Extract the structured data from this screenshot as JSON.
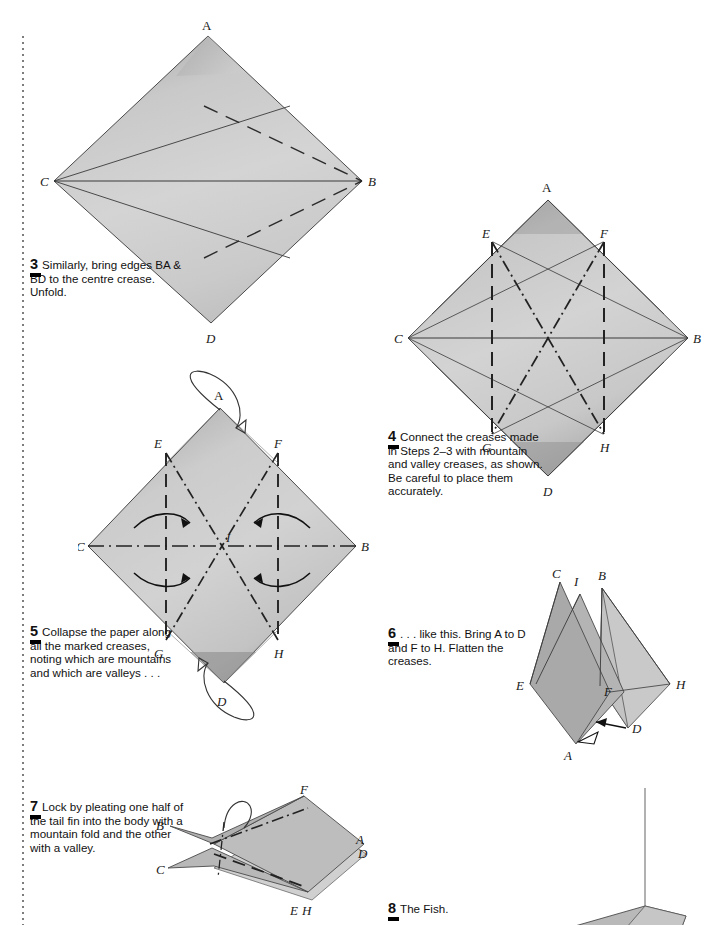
{
  "page": {
    "width": 716,
    "height": 925,
    "background": "#ffffff",
    "rule_color": "#7d7d7d",
    "paper_light": "#d2d2d2",
    "paper_mid": "#c2c2c2",
    "paper_dark": "#a6a6a6",
    "paper_darker": "#8f8f8f",
    "line_color": "#2b2b2b"
  },
  "steps": [
    {
      "id": "step-3",
      "number": "3",
      "lines": [
        "Similarly, bring",
        "edges BA & BD to",
        "the centre crease.",
        "Unfold."
      ],
      "text": "Similarly, bring edges BA & BD to the centre crease. Unfold.",
      "figure": {
        "name": "diamond-creases-step3",
        "labels": [
          "A",
          "B",
          "C",
          "D"
        ],
        "vertex_labels": {
          "A": "A",
          "B": "B",
          "C": "C",
          "D": "D"
        }
      }
    },
    {
      "id": "step-4",
      "number": "4",
      "lines": [
        "Connect the",
        "creases made in",
        "Steps 2–3 with",
        "mountain and valley",
        "creases, as shown. Be",
        "careful to place",
        "them accurately."
      ],
      "text": "Connect the creases made in Steps 2–3 with mountain and valley creases, as shown. Be careful to place them accurately.",
      "figure": {
        "name": "diamond-creases-step4",
        "labels": [
          "A",
          "B",
          "C",
          "D",
          "E",
          "F",
          "G",
          "H"
        ],
        "vertex_labels": {
          "A": "A",
          "B": "B",
          "C": "C",
          "D": "D",
          "E": "E",
          "F": "F",
          "G": "G",
          "H": "H"
        }
      }
    },
    {
      "id": "step-5",
      "number": "5",
      "lines": [
        "Collapse the",
        "paper along all",
        "the marked creases,",
        "noting which are",
        "mountains and",
        "which are valleys . . ."
      ],
      "text": "Collapse the paper along all the marked creases, noting which are mountains and which are valleys . . .",
      "figure": {
        "name": "diamond-collapse-step5",
        "labels": [
          "A",
          "B",
          "C",
          "D",
          "E",
          "F",
          "G",
          "H",
          "I"
        ],
        "vertex_labels": {
          "A": "A",
          "B": "B",
          "C": "C",
          "D": "D",
          "E": "E",
          "F": "F",
          "G": "G",
          "H": "H",
          "I": "I"
        }
      }
    },
    {
      "id": "step-6",
      "number": "6",
      "lines": [
        ". . . like this. Bring",
        "A to D and F to H.",
        "Flatten the creases."
      ],
      "text": ". . . like this. Bring A to D and F to H. Flatten the creases.",
      "figure": {
        "name": "folded-form-step6",
        "labels": [
          "A",
          "B",
          "C",
          "D",
          "E",
          "F",
          "H",
          "I"
        ],
        "vertex_labels": {
          "A": "A",
          "B": "B",
          "C": "C",
          "D": "D",
          "E": "E",
          "F": "F",
          "H": "H",
          "I": "I"
        }
      }
    },
    {
      "id": "step-7",
      "number": "7",
      "lines": [
        "Lock by pleating",
        "one half of the",
        "tail fin into the body",
        "with a mountain",
        "fold and the other",
        "with a valley."
      ],
      "text": "Lock by pleating one half of the tail fin into the body with a mountain fold and the other with a valley.",
      "figure": {
        "name": "tail-pleat-step7",
        "labels": [
          "A",
          "B",
          "C",
          "D",
          "E",
          "F",
          "H"
        ],
        "vertex_labels": {
          "A": "A",
          "B": "B",
          "C": "C",
          "D": "D",
          "E": "E",
          "F": "F",
          "H": "H"
        }
      }
    },
    {
      "id": "step-8",
      "number": "8",
      "lines": [
        "The Fish."
      ],
      "text": "The Fish.",
      "figure": {
        "name": "finished-fish-step8",
        "labels": [],
        "vertex_labels": {}
      }
    }
  ]
}
